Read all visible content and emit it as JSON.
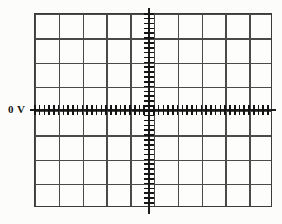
{
  "figure": {
    "kind": "oscilloscope-graticule",
    "background_color": "#fcfcfa",
    "grid_color": "#4a4a4a",
    "axis_color": "#1c1c1c",
    "border_color": "#3b3b3b"
  },
  "labels": {
    "zero_volt": "0 V"
  },
  "chart_data": {
    "type": "line",
    "title": "",
    "subtitle": "",
    "xlabel": "",
    "ylabel": "",
    "annotations": [
      {
        "text": "0 V",
        "position": "left-of-horizontal-axis",
        "x_div": -5.2,
        "y_div": 0
      }
    ],
    "grid": true,
    "legend": "none",
    "divisions": {
      "horizontal": 10,
      "vertical": 8,
      "subdivisions_per_division": 5
    },
    "xlim": [
      -5,
      5
    ],
    "ylim": [
      -4,
      4
    ],
    "xticks": [
      -5,
      -4,
      -3,
      -2,
      -1,
      0,
      1,
      2,
      3,
      4,
      5
    ],
    "yticks": [
      -4,
      -3,
      -2,
      -1,
      0,
      1,
      2,
      3,
      4
    ],
    "axes": {
      "horizontal_axis_value": 0,
      "vertical_axis_value": 0,
      "horizontal_axis_label": "0 V"
    },
    "series": [],
    "values": [],
    "categories": [],
    "note": "Empty graticule: no trace plotted; only grid, center axes with tick subdivisions, and the 0 V baseline marker."
  }
}
